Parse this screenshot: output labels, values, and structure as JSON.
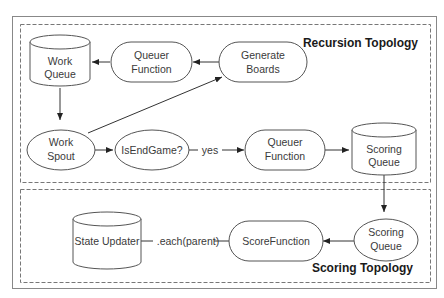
{
  "diagram": {
    "regions": [
      {
        "id": "recursion",
        "title": "Recursion Topology"
      },
      {
        "id": "scoring",
        "title": "Scoring Topology"
      }
    ],
    "nodes": {
      "work_queue": {
        "line1": "Work",
        "line2": "Queue",
        "shape": "cylinder"
      },
      "queuer_function_top": {
        "line1": "Queuer",
        "line2": "Function",
        "shape": "rounded-rect"
      },
      "generate_boards": {
        "line1": "Generate",
        "line2": "Boards",
        "shape": "rounded-rect"
      },
      "work_spout": {
        "line1": "Work",
        "line2": "Spout",
        "shape": "ellipse"
      },
      "is_end_game": {
        "label": "IsEndGame?",
        "shape": "ellipse"
      },
      "queuer_function_mid": {
        "line1": "Queuer",
        "line2": "Function",
        "shape": "rounded-rect"
      },
      "scoring_queue_top": {
        "line1": "Scoring",
        "line2": "Queue",
        "shape": "cylinder"
      },
      "scoring_queue_bottom": {
        "line1": "Scoring",
        "line2": "Queue",
        "shape": "ellipse"
      },
      "score_function": {
        "label": "ScoreFunction",
        "shape": "rounded-rect"
      },
      "state_updater": {
        "label": "State Updater",
        "shape": "cylinder"
      }
    },
    "edges": [
      {
        "from": "generate_boards",
        "to": "queuer_function_top",
        "label": ""
      },
      {
        "from": "queuer_function_top",
        "to": "work_queue",
        "label": ""
      },
      {
        "from": "work_queue",
        "to": "work_spout",
        "label": ""
      },
      {
        "from": "work_spout",
        "to": "generate_boards",
        "label": ""
      },
      {
        "from": "work_spout",
        "to": "is_end_game",
        "label": ""
      },
      {
        "from": "is_end_game",
        "to": "queuer_function_mid",
        "label": "yes"
      },
      {
        "from": "queuer_function_mid",
        "to": "scoring_queue_top",
        "label": ""
      },
      {
        "from": "scoring_queue_top",
        "to": "scoring_queue_bottom",
        "label": ""
      },
      {
        "from": "scoring_queue_bottom",
        "to": "score_function",
        "label": ""
      },
      {
        "from": "score_function",
        "to": "state_updater",
        "label": ".each(parent)"
      }
    ]
  }
}
